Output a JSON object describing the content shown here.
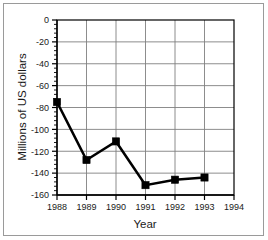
{
  "chart_data": {
    "type": "line",
    "title": "",
    "xlabel": "Year",
    "ylabel": "Millions of US dollars",
    "x": [
      1988,
      1989,
      1990,
      1991,
      1992,
      1993
    ],
    "values": [
      -75,
      -128,
      -111,
      -151,
      -146,
      -144
    ],
    "series": [
      {
        "name": "Millions of US dollars",
        "values": [
          -75,
          -128,
          -111,
          -151,
          -146,
          -144
        ]
      }
    ],
    "xlim": [
      1988,
      1994
    ],
    "ylim": [
      -160,
      0
    ],
    "xticks": [
      1988,
      1989,
      1990,
      1991,
      1992,
      1993,
      1994
    ],
    "xtick_labels": [
      "1988",
      "1989",
      "1990",
      "1991",
      "1992",
      "1993",
      "1994"
    ],
    "yticks": [
      0,
      -20,
      -40,
      -60,
      -80,
      -100,
      -120,
      -140,
      -160
    ],
    "ytick_labels": [
      "0",
      "-20",
      "-40",
      "-60",
      "-80",
      "-100",
      "-120",
      "-140",
      "-160"
    ],
    "y_minor_tick_interval": 4,
    "grid": "both",
    "grid_color": "#808080",
    "legend": "none",
    "line_color": "#000000",
    "marker": "square",
    "marker_color": "#000000",
    "background_color": "#ffffff",
    "frame_color": "#9a9a9a"
  }
}
